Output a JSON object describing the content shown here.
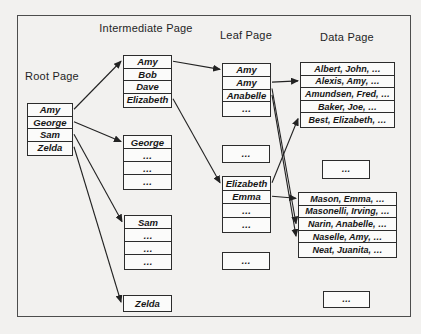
{
  "figure": {
    "columns": [
      {
        "id": "root",
        "label": "Root Page"
      },
      {
        "id": "intermediate",
        "label": "Intermediate Page"
      },
      {
        "id": "leaf",
        "label": "Leaf Page"
      },
      {
        "id": "data",
        "label": "Data Page"
      }
    ],
    "boxes": [
      {
        "id": "root-box",
        "column": "root",
        "x": 27,
        "y": 103,
        "w": 46,
        "rowH": 12.5,
        "rows": [
          "Amy",
          "George",
          "Sam",
          "Zelda"
        ]
      },
      {
        "id": "int-amy",
        "column": "intermediate",
        "x": 123,
        "y": 55,
        "w": 49,
        "rowH": 12.5,
        "rows": [
          "Amy",
          "Bob",
          "Dave",
          "Elizabeth"
        ]
      },
      {
        "id": "int-george",
        "column": "intermediate",
        "x": 123,
        "y": 135,
        "w": 49,
        "rowH": 13,
        "rows": [
          "George",
          "…",
          "…",
          "…"
        ]
      },
      {
        "id": "int-sam",
        "column": "intermediate",
        "x": 124,
        "y": 215,
        "w": 48,
        "rowH": 13,
        "rows": [
          "Sam",
          "…",
          "…",
          "…"
        ]
      },
      {
        "id": "int-zelda",
        "column": "intermediate",
        "x": 123,
        "y": 295,
        "w": 49,
        "rowH": 14,
        "rows": [
          "Zelda"
        ]
      },
      {
        "id": "leaf-amy",
        "column": "leaf",
        "x": 222,
        "y": 63,
        "w": 49,
        "rowH": 12.75,
        "rows": [
          "Amy",
          "Amy",
          "Anabelle",
          "…"
        ]
      },
      {
        "id": "leaf-dots-1",
        "column": "leaf",
        "x": 222,
        "y": 145,
        "w": 48,
        "rowH": 15,
        "rows": [
          "…"
        ]
      },
      {
        "id": "leaf-elizabeth",
        "column": "leaf",
        "x": 222,
        "y": 176,
        "w": 49,
        "rowH": 13.5,
        "rows": [
          "Elizabeth",
          "Emma",
          "…",
          "…"
        ]
      },
      {
        "id": "leaf-dots-2",
        "column": "leaf",
        "x": 222,
        "y": 252,
        "w": 48,
        "rowH": 15,
        "rows": [
          "…"
        ]
      },
      {
        "id": "data-a",
        "column": "data",
        "x": 300,
        "y": 62,
        "w": 95,
        "rowH": 12.6,
        "rows": [
          "Albert, John, …",
          "Alexis, Amy, …",
          "Amundsen, Fred, …",
          "Baker, Joe, …",
          "Best, Elizabeth, …"
        ]
      },
      {
        "id": "data-dots-1",
        "column": "data",
        "x": 322,
        "y": 160,
        "w": 48,
        "rowH": 16,
        "rows": [
          "…"
        ]
      },
      {
        "id": "data-b",
        "column": "data",
        "x": 298,
        "y": 192,
        "w": 99,
        "rowH": 12.6,
        "rows": [
          "Mason, Emma, …",
          "Masonelli, Irving, …",
          "Narin, Anabelle, …",
          "Naselle, Amy, …",
          "Neat, Juanita, …"
        ]
      },
      {
        "id": "data-dots-2",
        "column": "data",
        "x": 323,
        "y": 291,
        "w": 47,
        "rowH": 14,
        "rows": [
          "…"
        ]
      }
    ],
    "edges": [
      {
        "name": "root-amy-to-int-amy",
        "from": {
          "box": "root-box",
          "row": 0
        },
        "to": {
          "box": "int-amy",
          "row": 0
        }
      },
      {
        "name": "root-george-to-int-george",
        "from": {
          "box": "root-box",
          "row": 1
        },
        "to": {
          "box": "int-george",
          "row": 0
        }
      },
      {
        "name": "root-sam-to-int-sam",
        "from": {
          "box": "root-box",
          "row": 2
        },
        "to": {
          "box": "int-sam",
          "row": 0
        }
      },
      {
        "name": "root-zelda-to-int-zelda",
        "from": {
          "box": "root-box",
          "row": 3
        },
        "to": {
          "box": "int-zelda",
          "row": 0
        }
      },
      {
        "name": "int-amy-to-leaf-amy",
        "from": {
          "box": "int-amy",
          "row": 0
        },
        "to": {
          "box": "leaf-amy",
          "row": 0
        }
      },
      {
        "name": "int-elizabeth-to-leaf-elizabeth",
        "from": {
          "box": "int-amy",
          "row": 3
        },
        "to": {
          "box": "leaf-elizabeth",
          "row": 0
        }
      },
      {
        "name": "leaf-amy-to-data-alexis",
        "from": {
          "box": "leaf-amy",
          "row": 1
        },
        "to": {
          "box": "data-a",
          "row": 1
        }
      },
      {
        "name": "leaf-amy-to-data-narin",
        "from": {
          "box": "leaf-amy",
          "row": 1,
          "anchor": "bottom"
        },
        "to": {
          "box": "data-b",
          "row": 2
        }
      },
      {
        "name": "leaf-anabelle-to-data-naselle",
        "from": {
          "box": "leaf-amy",
          "row": 2
        },
        "to": {
          "box": "data-b",
          "row": 3
        }
      },
      {
        "name": "leaf-elizabeth-to-data-best",
        "from": {
          "box": "leaf-elizabeth",
          "row": 0
        },
        "to": {
          "box": "data-a",
          "row": 4
        }
      },
      {
        "name": "leaf-emma-to-data-mason",
        "from": {
          "box": "leaf-elizabeth",
          "row": 1
        },
        "to": {
          "box": "data-b",
          "row": 0
        }
      }
    ]
  }
}
